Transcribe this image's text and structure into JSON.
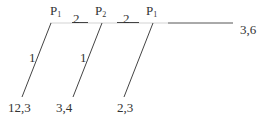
{
  "diagram": {
    "colors": {
      "line": "#444444",
      "faint_line": "#bbbbbb",
      "text": "#333333"
    },
    "nodes": [
      {
        "id": "p1a",
        "label": "P",
        "sub": "1"
      },
      {
        "id": "p2",
        "label": "P",
        "sub": "2"
      },
      {
        "id": "p1b",
        "label": "P",
        "sub": "1"
      }
    ],
    "edge_labels": {
      "top1": "2",
      "top2": "2",
      "diag1": "1",
      "diag2": "1"
    },
    "endpoints": {
      "right": "3,6",
      "bottom1": "12,3",
      "bottom2": "3,4",
      "bottom3": "2,3"
    }
  }
}
